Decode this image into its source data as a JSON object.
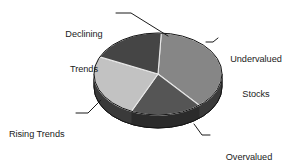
{
  "chart_data": {
    "type": "pie",
    "title": "",
    "subtitle": "",
    "xlabel": "",
    "ylabel": "",
    "legend_position": "none",
    "grid": false,
    "style": "3d-exploded-free",
    "categories": [
      "Undervalued Stocks",
      "Overvalued Stocks",
      "Rising Trends",
      "Declining Trends"
    ],
    "values": [
      38,
      18,
      25,
      19
    ],
    "unit": "percent",
    "start_angle_deg": 3,
    "direction": "clockwise",
    "slices": [
      {
        "label": "Undervalued Stocks",
        "label_line_1": "Undervalued",
        "label_line_2": "Stocks",
        "value": 38,
        "start_angle_deg": 3,
        "end_angle_deg": 140,
        "color": "#868686",
        "side_color": "#3a3a3a",
        "label_position": "right"
      },
      {
        "label": "Overvalued Stocks",
        "label_line_1": "Overvalued",
        "label_line_2": "Stocks",
        "value": 18,
        "start_angle_deg": 140,
        "end_angle_deg": 205,
        "color": "#555555",
        "side_color": "#2b2b2b",
        "label_position": "bottom-right"
      },
      {
        "label": "Rising Trends",
        "label_line_1": "Rising Trends",
        "label_line_2": "",
        "value": 25,
        "start_angle_deg": 205,
        "end_angle_deg": 295,
        "color": "#c2c2c2",
        "side_color": "#3a3a3a",
        "label_position": "left"
      },
      {
        "label": "Declining Trends",
        "label_line_1": "Declining",
        "label_line_2": "Trends",
        "value": 19,
        "start_angle_deg": 295,
        "end_angle_deg": 363,
        "color": "#454545",
        "side_color": "#262626",
        "label_position": "top-left"
      }
    ],
    "colors": {
      "undervalued": "#868686",
      "overvalued": "#555555",
      "rising": "#c2c2c2",
      "declining": "#454545",
      "rim": "#333333",
      "outline": "#151515",
      "leader_line": "#1b1b1b",
      "background": "#ffffff",
      "label_text": "#1b1b1b"
    }
  },
  "chart": {
    "background_color": "#ffffff"
  },
  "labels": {
    "declining": {
      "line1": "Declining",
      "line2": "Trends"
    },
    "undervalued": {
      "line1": "Undervalued",
      "line2": "Stocks"
    },
    "overvalued": {
      "line1": "Overvalued",
      "line2": "Stocks"
    },
    "rising": {
      "line1": "Rising Trends",
      "line2": ""
    }
  }
}
